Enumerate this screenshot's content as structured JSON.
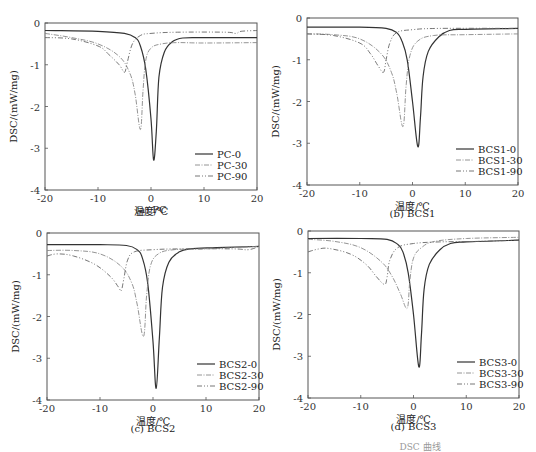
{
  "figure_caption_partial": "DSC 曲线",
  "common": {
    "xlabel": "温度/℃",
    "ylabel": "DSC/(mW/mg)",
    "xlim": [
      -20,
      20
    ],
    "ylim": [
      -4,
      0
    ],
    "xticks": [
      "-20",
      "-10",
      "0",
      "10",
      "20"
    ],
    "yticks": [
      "0",
      "-1",
      "-2",
      "-3",
      "-4"
    ]
  },
  "panels": [
    {
      "caption": "(a) PC",
      "legend": [
        "PC-0",
        "PC-30",
        "PC-90"
      ]
    },
    {
      "caption": "(b) BCS1",
      "legend": [
        "BCS1-0",
        "BCS1-30",
        "BCS1-90"
      ]
    },
    {
      "caption": "(c) BCS2",
      "legend": [
        "BCS2-0",
        "BCS2-30",
        "BCS2-90"
      ]
    },
    {
      "caption": "(d) BCS3",
      "legend": [
        "BCS3-0",
        "BCS3-30",
        "BCS3-90"
      ]
    }
  ],
  "chart_data": [
    {
      "type": "line",
      "title": "(a) PC",
      "xlabel": "温度/℃",
      "ylabel": "DSC/(mW/mg)",
      "xlim": [
        -20,
        20
      ],
      "ylim": [
        -4,
        0
      ],
      "grid": false,
      "legend_position": "lower right",
      "series": [
        {
          "name": "PC-0",
          "peak": {
            "x": 0.5,
            "y": -3.28
          },
          "baseline_left": -0.2,
          "baseline_right": -0.35,
          "points": [
            [
              -20,
              -0.18
            ],
            [
              -10,
              -0.2
            ],
            [
              -5,
              -0.25
            ],
            [
              -3,
              -0.35
            ],
            [
              -2,
              -0.55
            ],
            [
              -1,
              -1.1
            ],
            [
              0,
              -2.3
            ],
            [
              0.5,
              -3.28
            ],
            [
              1,
              -2.6
            ],
            [
              1.5,
              -1.3
            ],
            [
              2.5,
              -0.7
            ],
            [
              4,
              -0.45
            ],
            [
              6,
              -0.36
            ],
            [
              10,
              -0.35
            ],
            [
              20,
              -0.35
            ]
          ]
        },
        {
          "name": "PC-30",
          "peak": {
            "x": -2.0,
            "y": -2.55
          },
          "baseline_left": -0.25,
          "baseline_right": -0.45,
          "points": [
            [
              -20,
              -0.25
            ],
            [
              -15,
              -0.35
            ],
            [
              -10,
              -0.5
            ],
            [
              -6,
              -0.8
            ],
            [
              -4,
              -1.2
            ],
            [
              -3,
              -1.7
            ],
            [
              -2,
              -2.55
            ],
            [
              -1.5,
              -1.6
            ],
            [
              -1,
              -0.9
            ],
            [
              0,
              -0.6
            ],
            [
              2,
              -0.5
            ],
            [
              5,
              -0.47
            ],
            [
              10,
              -0.48
            ],
            [
              20,
              -0.47
            ]
          ]
        },
        {
          "name": "PC-90",
          "peak": {
            "x": -5.0,
            "y": -1.18
          },
          "baseline_left": -0.35,
          "baseline_right": -0.2,
          "points": [
            [
              -20,
              -0.35
            ],
            [
              -15,
              -0.38
            ],
            [
              -10,
              -0.55
            ],
            [
              -8,
              -0.75
            ],
            [
              -6,
              -1.0
            ],
            [
              -5,
              -1.18
            ],
            [
              -4.5,
              -0.95
            ],
            [
              -3.5,
              -0.5
            ],
            [
              -2,
              -0.3
            ],
            [
              0,
              -0.25
            ],
            [
              5,
              -0.22
            ],
            [
              14,
              -0.22
            ],
            [
              16,
              -0.25
            ],
            [
              17,
              -0.2
            ],
            [
              20,
              -0.18
            ]
          ]
        }
      ]
    },
    {
      "type": "line",
      "title": "(b) BCS1",
      "xlabel": "温度/℃",
      "ylabel": "DSC/(mW/mg)",
      "xlim": [
        -20,
        20
      ],
      "ylim": [
        -4,
        0
      ],
      "grid": false,
      "legend_position": "lower right",
      "series": [
        {
          "name": "BCS1-0",
          "peak": {
            "x": 1.0,
            "y": -3.08
          },
          "baseline_left": -0.22,
          "baseline_right": -0.25,
          "points": [
            [
              -20,
              -0.22
            ],
            [
              -10,
              -0.22
            ],
            [
              -5,
              -0.25
            ],
            [
              -3,
              -0.35
            ],
            [
              -2,
              -0.55
            ],
            [
              -1,
              -1.0
            ],
            [
              0,
              -2.0
            ],
            [
              1,
              -3.08
            ],
            [
              1.5,
              -2.4
            ],
            [
              2,
              -1.4
            ],
            [
              3,
              -0.8
            ],
            [
              5,
              -0.45
            ],
            [
              7,
              -0.3
            ],
            [
              10,
              -0.27
            ],
            [
              20,
              -0.25
            ]
          ]
        },
        {
          "name": "BCS1-30",
          "peak": {
            "x": -1.8,
            "y": -2.6
          },
          "baseline_left": -0.38,
          "baseline_right": -0.38,
          "points": [
            [
              -20,
              -0.38
            ],
            [
              -15,
              -0.4
            ],
            [
              -10,
              -0.5
            ],
            [
              -6,
              -0.85
            ],
            [
              -4,
              -1.3
            ],
            [
              -3,
              -1.8
            ],
            [
              -1.8,
              -2.6
            ],
            [
              -1.2,
              -1.6
            ],
            [
              -0.5,
              -0.9
            ],
            [
              1,
              -0.55
            ],
            [
              4,
              -0.42
            ],
            [
              10,
              -0.4
            ],
            [
              20,
              -0.38
            ]
          ]
        },
        {
          "name": "BCS1-90",
          "peak": {
            "x": -5.5,
            "y": -1.3
          },
          "baseline_left": -0.38,
          "baseline_right": -0.25,
          "points": [
            [
              -20,
              -0.38
            ],
            [
              -15,
              -0.42
            ],
            [
              -10,
              -0.6
            ],
            [
              -8,
              -0.85
            ],
            [
              -6.5,
              -1.15
            ],
            [
              -5.5,
              -1.3
            ],
            [
              -5,
              -1.0
            ],
            [
              -4.3,
              -0.6
            ],
            [
              -3,
              -0.35
            ],
            [
              0,
              -0.28
            ],
            [
              5,
              -0.25
            ],
            [
              20,
              -0.25
            ]
          ]
        }
      ]
    },
    {
      "type": "line",
      "title": "(c) BCS2",
      "xlabel": "温度/℃",
      "ylabel": "DSC/(mW/mg)",
      "xlim": [
        -20,
        20
      ],
      "ylim": [
        -4,
        0
      ],
      "grid": false,
      "legend_position": "lower right",
      "series": [
        {
          "name": "BCS2-0",
          "peak": {
            "x": 0.6,
            "y": -3.72
          },
          "baseline_left": -0.28,
          "baseline_right": -0.32,
          "points": [
            [
              -20,
              -0.28
            ],
            [
              -10,
              -0.28
            ],
            [
              -5,
              -0.3
            ],
            [
              -3,
              -0.4
            ],
            [
              -2,
              -0.6
            ],
            [
              -1,
              -1.2
            ],
            [
              0,
              -2.6
            ],
            [
              0.6,
              -3.72
            ],
            [
              1.2,
              -2.5
            ],
            [
              1.8,
              -1.3
            ],
            [
              3,
              -0.7
            ],
            [
              5,
              -0.45
            ],
            [
              7,
              -0.38
            ],
            [
              12,
              -0.35
            ],
            [
              20,
              -0.32
            ]
          ]
        },
        {
          "name": "BCS2-30",
          "peak": {
            "x": -1.8,
            "y": -2.48
          },
          "baseline_left": -0.42,
          "baseline_right": -0.32,
          "points": [
            [
              -20,
              -0.42
            ],
            [
              -15,
              -0.42
            ],
            [
              -10,
              -0.5
            ],
            [
              -6,
              -0.8
            ],
            [
              -4,
              -1.2
            ],
            [
              -3,
              -1.7
            ],
            [
              -1.8,
              -2.48
            ],
            [
              -1.2,
              -1.5
            ],
            [
              -0.5,
              -0.8
            ],
            [
              1,
              -0.5
            ],
            [
              4,
              -0.4
            ],
            [
              10,
              -0.38
            ],
            [
              20,
              -0.32
            ]
          ]
        },
        {
          "name": "BCS2-90",
          "peak": {
            "x": -6.0,
            "y": -1.38
          },
          "baseline_left": -0.55,
          "baseline_right": -0.32,
          "points": [
            [
              -20,
              -0.55
            ],
            [
              -18,
              -0.5
            ],
            [
              -15,
              -0.55
            ],
            [
              -11,
              -0.75
            ],
            [
              -8,
              -1.05
            ],
            [
              -6.5,
              -1.3
            ],
            [
              -6,
              -1.38
            ],
            [
              -5.5,
              -1.1
            ],
            [
              -4.8,
              -0.65
            ],
            [
              -3.5,
              -0.45
            ],
            [
              0,
              -0.4
            ],
            [
              5,
              -0.38
            ],
            [
              15,
              -0.38
            ],
            [
              18,
              -0.4
            ],
            [
              20,
              -0.32
            ]
          ]
        }
      ]
    },
    {
      "type": "line",
      "title": "(d) BCS3",
      "xlabel": "温度/℃",
      "ylabel": "DSC/(mW/mg)",
      "xlim": [
        -20,
        20
      ],
      "ylim": [
        -4,
        0
      ],
      "grid": false,
      "legend_position": "lower right",
      "series": [
        {
          "name": "BCS3-0",
          "peak": {
            "x": 1.0,
            "y": -3.25
          },
          "baseline_left": -0.18,
          "baseline_right": -0.22,
          "points": [
            [
              -20,
              -0.18
            ],
            [
              -10,
              -0.18
            ],
            [
              -5,
              -0.2
            ],
            [
              -3,
              -0.32
            ],
            [
              -2,
              -0.5
            ],
            [
              -1,
              -1.0
            ],
            [
              0,
              -2.0
            ],
            [
              1,
              -3.25
            ],
            [
              1.5,
              -2.5
            ],
            [
              2,
              -1.4
            ],
            [
              3,
              -0.8
            ],
            [
              5,
              -0.45
            ],
            [
              7,
              -0.3
            ],
            [
              10,
              -0.26
            ],
            [
              20,
              -0.22
            ]
          ]
        },
        {
          "name": "BCS3-30",
          "peak": {
            "x": -1.2,
            "y": -1.85
          },
          "baseline_left": -0.2,
          "baseline_right": -0.15,
          "points": [
            [
              -20,
              -0.2
            ],
            [
              -15,
              -0.25
            ],
            [
              -10,
              -0.4
            ],
            [
              -6,
              -0.75
            ],
            [
              -4,
              -1.1
            ],
            [
              -2.5,
              -1.5
            ],
            [
              -1.2,
              -1.85
            ],
            [
              -0.7,
              -1.2
            ],
            [
              0,
              -0.65
            ],
            [
              1.5,
              -0.4
            ],
            [
              4,
              -0.25
            ],
            [
              10,
              -0.18
            ],
            [
              20,
              -0.15
            ]
          ]
        },
        {
          "name": "BCS3-90",
          "peak": {
            "x": -5.5,
            "y": -1.28
          },
          "baseline_left": -0.5,
          "baseline_right": -0.22,
          "points": [
            [
              -20,
              -0.5
            ],
            [
              -18,
              -0.43
            ],
            [
              -16,
              -0.42
            ],
            [
              -12,
              -0.55
            ],
            [
              -9,
              -0.8
            ],
            [
              -7,
              -1.1
            ],
            [
              -5.5,
              -1.28
            ],
            [
              -5,
              -1.1
            ],
            [
              -4.5,
              -0.7
            ],
            [
              -3,
              -0.4
            ],
            [
              0,
              -0.3
            ],
            [
              5,
              -0.26
            ],
            [
              12,
              -0.25
            ],
            [
              20,
              -0.22
            ]
          ]
        }
      ]
    }
  ]
}
